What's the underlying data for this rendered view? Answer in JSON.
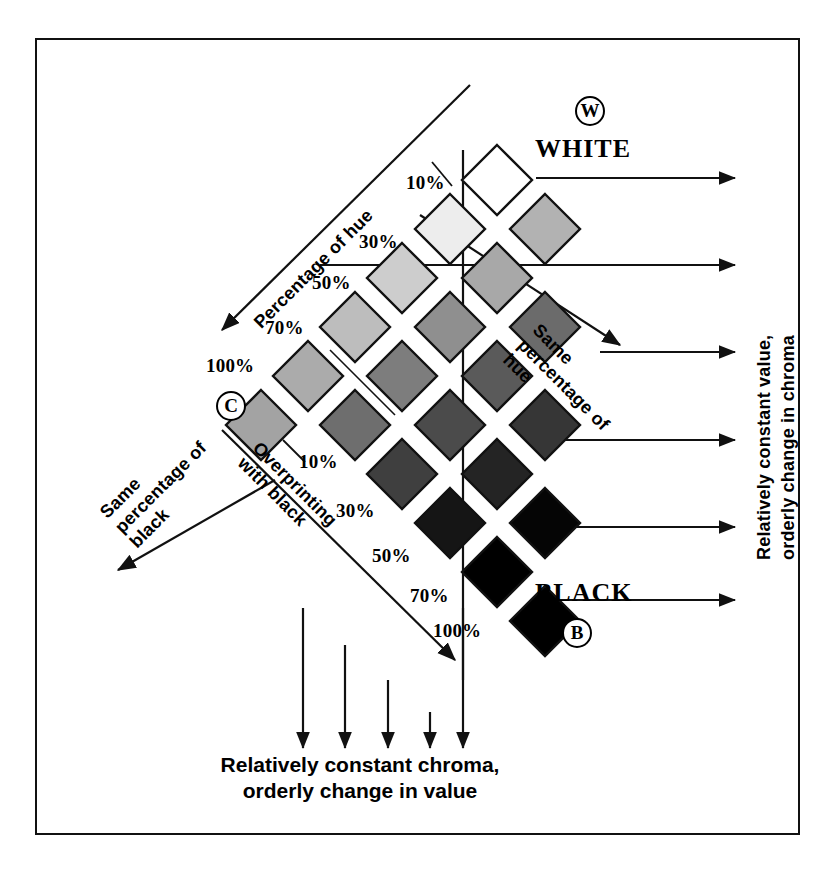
{
  "figure": {
    "white_label": "WHITE",
    "black_label": "BLACK",
    "white_marker": "W",
    "black_marker": "B",
    "chroma_marker": "C"
  },
  "axis_labels": {
    "hue_diagonal": "Percentage of hue",
    "overprint_diagonal": "Overprinting with black",
    "same_black_diagonal": "Same percentage of black",
    "same_hue_diagonal": "Same percentage of hue",
    "right_vertical_line1": "Relatively constant value,",
    "right_vertical_line2": "orderly change in chroma",
    "bottom_line1": "Relatively constant chroma,",
    "bottom_line2": "orderly change in value"
  },
  "hue_ticks": [
    "10%",
    "30%",
    "50%",
    "70%",
    "100%"
  ],
  "black_ticks": [
    "10%",
    "30%",
    "50%",
    "70%",
    "100%"
  ],
  "chart_data": {
    "type": "heatmap",
    "xlabel": "Percentage of hue",
    "ylabel": "Overprinting with black",
    "hue_steps": [
      "10%",
      "30%",
      "50%",
      "70%",
      "100%"
    ],
    "black_steps": [
      "10%",
      "30%",
      "50%",
      "70%",
      "100%"
    ],
    "grid": false,
    "legend": "none",
    "note": "Diamond (rotated square) swatches arranged on a rhombic lattice; value darkens down-right toward BLACK and lightens up-right toward WHITE",
    "swatches": [
      {
        "id": "white-ref",
        "row": 0,
        "col": 0,
        "cx": 497,
        "cy": 180,
        "size": 70,
        "fill": "#ffffff",
        "stroke": "#111111"
      },
      {
        "id": "h10",
        "row": 1,
        "col": 0,
        "cx": 450,
        "cy": 229,
        "size": 70,
        "fill": "#ededed",
        "stroke": "#111111"
      },
      {
        "id": "h30",
        "row": 2,
        "col": 0,
        "cx": 402,
        "cy": 278,
        "size": 70,
        "fill": "#cdcdcd",
        "stroke": "#111111"
      },
      {
        "id": "h50",
        "row": 3,
        "col": 0,
        "cx": 355,
        "cy": 327,
        "size": 70,
        "fill": "#bdbdbd",
        "stroke": "#111111"
      },
      {
        "id": "h70",
        "row": 4,
        "col": 0,
        "cx": 308,
        "cy": 376,
        "size": 70,
        "fill": "#ababab",
        "stroke": "#111111"
      },
      {
        "id": "h100",
        "row": 5,
        "col": 0,
        "cx": 261,
        "cy": 425,
        "size": 70,
        "fill": "#a3a3a3",
        "stroke": "#111111"
      },
      {
        "id": "r1c1",
        "row": 1,
        "col": 1,
        "cx": 545,
        "cy": 229,
        "size": 70,
        "fill": "#b2b2b2",
        "stroke": "#111111"
      },
      {
        "id": "r2c1",
        "row": 2,
        "col": 1,
        "cx": 497,
        "cy": 278,
        "size": 70,
        "fill": "#a8a8a8",
        "stroke": "#111111"
      },
      {
        "id": "r3c1",
        "row": 3,
        "col": 1,
        "cx": 450,
        "cy": 327,
        "size": 70,
        "fill": "#8f8f8f",
        "stroke": "#111111"
      },
      {
        "id": "r4c1",
        "row": 4,
        "col": 1,
        "cx": 402,
        "cy": 376,
        "size": 70,
        "fill": "#7d7d7d",
        "stroke": "#111111"
      },
      {
        "id": "r5c1",
        "row": 5,
        "col": 1,
        "cx": 355,
        "cy": 425,
        "size": 70,
        "fill": "#6e6e6e",
        "stroke": "#111111"
      },
      {
        "id": "r3c2",
        "row": 3,
        "col": 2,
        "cx": 545,
        "cy": 327,
        "size": 70,
        "fill": "#6b6b6b",
        "stroke": "#111111"
      },
      {
        "id": "r4c2",
        "row": 4,
        "col": 2,
        "cx": 497,
        "cy": 376,
        "size": 70,
        "fill": "#5a5a5a",
        "stroke": "#111111"
      },
      {
        "id": "r5c2",
        "row": 5,
        "col": 2,
        "cx": 450,
        "cy": 425,
        "size": 70,
        "fill": "#4b4b4b",
        "stroke": "#111111"
      },
      {
        "id": "r6c2",
        "row": 6,
        "col": 2,
        "cx": 402,
        "cy": 474,
        "size": 70,
        "fill": "#3f3f3f",
        "stroke": "#111111"
      },
      {
        "id": "r5c3",
        "row": 5,
        "col": 3,
        "cx": 545,
        "cy": 425,
        "size": 70,
        "fill": "#363636",
        "stroke": "#111111"
      },
      {
        "id": "r6c3",
        "row": 6,
        "col": 3,
        "cx": 497,
        "cy": 474,
        "size": 70,
        "fill": "#242424",
        "stroke": "#111111"
      },
      {
        "id": "r7c3",
        "row": 7,
        "col": 3,
        "cx": 450,
        "cy": 523,
        "size": 70,
        "fill": "#151515",
        "stroke": "#111111"
      },
      {
        "id": "r7c4",
        "row": 7,
        "col": 4,
        "cx": 545,
        "cy": 523,
        "size": 70,
        "fill": "#050505",
        "stroke": "#111111"
      },
      {
        "id": "r8c4",
        "row": 8,
        "col": 4,
        "cx": 497,
        "cy": 572,
        "size": 70,
        "fill": "#000000",
        "stroke": "#111111"
      },
      {
        "id": "r9c5",
        "row": 9,
        "col": 5,
        "cx": 545,
        "cy": 621,
        "size": 70,
        "fill": "#000000",
        "stroke": "#111111"
      }
    ],
    "right_arrow_rows_y": [
      178,
      265,
      352,
      440,
      527,
      600
    ],
    "bottom_arrow_cols_x": [
      265,
      320,
      375,
      425,
      470
    ]
  }
}
